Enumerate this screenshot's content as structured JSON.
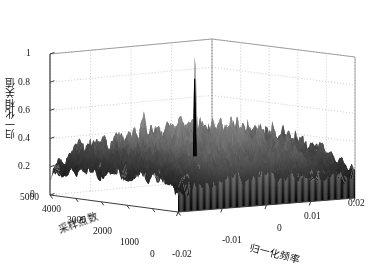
{
  "figure": {
    "kind": "matlab-3d-mesh-surface",
    "background_color": "#ffffff",
    "axis_line_color": "#3c3c3c",
    "grid_color": "#b4b4b4",
    "surface_color_light": "#9a9a9a",
    "surface_color_mid": "#6e6e6e",
    "surface_color_dark": "#101010",
    "peak_color": "#000000"
  },
  "axes": {
    "z": {
      "title": "归一化相关值",
      "ticks": [
        "0",
        "0.2",
        "0.4",
        "0.6",
        "0.8",
        "1"
      ],
      "values": [
        0,
        0.2,
        0.4,
        0.6,
        0.8,
        1
      ],
      "range": [
        0,
        1
      ]
    },
    "x": {
      "title": "采样点数",
      "ticks": [
        "0",
        "1000",
        "2000",
        "3000",
        "4000",
        "5000"
      ],
      "values": [
        0,
        1000,
        2000,
        3000,
        4000,
        5000
      ],
      "range": [
        0,
        5000
      ],
      "direction": "descending-left"
    },
    "y": {
      "title": "归一化频率",
      "ticks": [
        "-0.02",
        "-0.01",
        "0",
        "0.01",
        "0.02"
      ],
      "values": [
        -0.02,
        -0.01,
        0,
        0.01,
        0.02
      ],
      "range": [
        -0.02,
        0.02
      ]
    }
  },
  "chart_data": {
    "type": "surface",
    "title": "",
    "xlabel": "采样点数",
    "ylabel": "归一化频率",
    "zlabel": "归一化相关值",
    "xlim": [
      0,
      5000
    ],
    "ylim": [
      -0.02,
      0.02
    ],
    "zlim": [
      0,
      1
    ],
    "grid": true,
    "legend": "none",
    "colormap": "gray",
    "noise_floor_typical": 0.3,
    "noise_floor_peaks_typical": 0.55,
    "main_peak": {
      "x_samples": 2650,
      "y_normalized_frequency": 0.0,
      "z_value": 0.83,
      "label": "相关峰"
    },
    "annotations": [],
    "z_tick_values": [
      0,
      0.2,
      0.4,
      0.6,
      0.8,
      1
    ],
    "x_tick_values": [
      0,
      1000,
      2000,
      3000,
      4000,
      5000
    ],
    "y_tick_values": [
      -0.02,
      -0.01,
      0,
      0.01,
      0.02
    ]
  },
  "tick_positions": {
    "z": [
      {
        "label": "1",
        "left": 26,
        "top": 49
      },
      {
        "label": "0.8",
        "left": 18,
        "top": 78
      },
      {
        "label": "0.6",
        "left": 18,
        "top": 106
      },
      {
        "label": "0.4",
        "left": 18,
        "top": 134
      },
      {
        "label": "0.2",
        "left": 18,
        "top": 162
      },
      {
        "label": "0",
        "left": 30,
        "top": 190
      }
    ],
    "x": [
      {
        "label": "5000",
        "left": 20,
        "top": 193
      },
      {
        "label": "4000",
        "left": 42,
        "top": 205
      },
      {
        "label": "3000",
        "left": 67,
        "top": 216
      },
      {
        "label": "2000",
        "left": 93,
        "top": 227
      },
      {
        "label": "1000",
        "left": 120,
        "top": 238
      },
      {
        "label": "0",
        "left": 150,
        "top": 250
      }
    ],
    "y": [
      {
        "label": "-0.02",
        "left": 172,
        "top": 250
      },
      {
        "label": "-0.01",
        "left": 222,
        "top": 236
      },
      {
        "label": "0",
        "left": 277,
        "top": 224
      },
      {
        "label": "0.01",
        "left": 304,
        "top": 212
      },
      {
        "label": "0.02",
        "left": 348,
        "top": 199
      }
    ]
  }
}
